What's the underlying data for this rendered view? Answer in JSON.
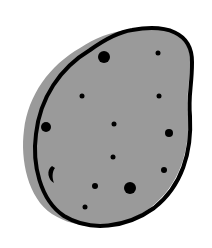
{
  "illustration": {
    "subject": "potato-icon",
    "colors": {
      "background": "#ffffff",
      "fill": "#9a9a9a",
      "outline": "#000000",
      "spots": "#000000"
    }
  }
}
